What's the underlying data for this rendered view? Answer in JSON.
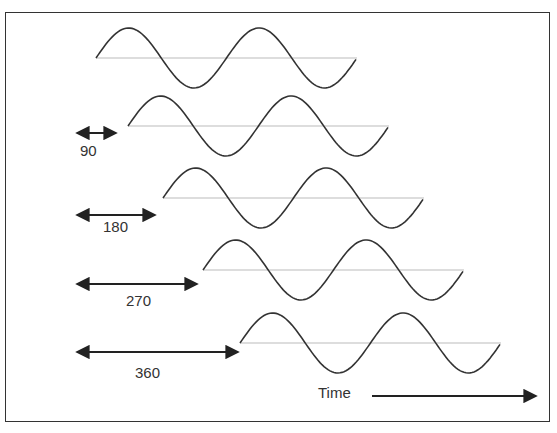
{
  "diagram": {
    "waves": [
      {
        "phase_label": "",
        "start_x": 96,
        "baseline_y": 58
      },
      {
        "phase_label": "90",
        "start_x": 128,
        "baseline_y": 126
      },
      {
        "phase_label": "180",
        "start_x": 163,
        "baseline_y": 198
      },
      {
        "phase_label": "270",
        "start_x": 203,
        "baseline_y": 270
      },
      {
        "phase_label": "360",
        "start_x": 240,
        "baseline_y": 343
      }
    ],
    "labels": {
      "phase_90": "90",
      "phase_180": "180",
      "phase_270": "270",
      "phase_360": "360",
      "time": "Time"
    },
    "colors": {
      "wave": "#333333",
      "baseline": "#bbbbbb",
      "arrow": "#222222"
    }
  }
}
